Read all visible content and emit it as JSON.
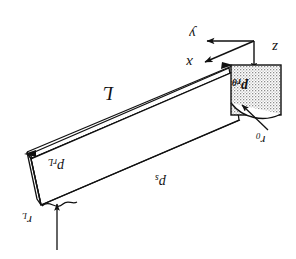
{
  "figure": {
    "type": "engineering-diagram",
    "background_color": "#ffffff",
    "line_color": "#111111",
    "stipple_color": "#9a9a9a",
    "width": 296,
    "height": 259
  },
  "axes": {
    "origin_label": "",
    "x": {
      "label": "x",
      "direction": "down-left-diagonal"
    },
    "y": {
      "label": "y",
      "direction": "left-horizontal"
    },
    "z": {
      "label": "z",
      "direction": "down-vertical"
    }
  },
  "labels": {
    "length": {
      "text": "L",
      "meaning": "bar length"
    },
    "p_rL": {
      "base": "p",
      "sub": "rL",
      "meaning": "radial pressure at far end"
    },
    "p_s": {
      "base": "p",
      "sub": "s",
      "meaning": "surface pressure"
    },
    "p_rtheta": {
      "base": "p",
      "sub": "rθ",
      "meaning": "radial-tangential pressure on end face"
    },
    "r_0": {
      "base": "r",
      "sub": "0",
      "meaning": "inner radius at near end"
    },
    "r_L": {
      "base": "r",
      "sub": "L",
      "meaning": "radius at far end"
    }
  },
  "annotations": {
    "end_face_fill": "stippled",
    "break_line": "wavy break at lower-left edge",
    "arc": "quarter-circle arc inside end face",
    "leader_r0": "arrow from r0 label to arc centre",
    "leader_rL": "vertical arrow up to wavy break"
  }
}
